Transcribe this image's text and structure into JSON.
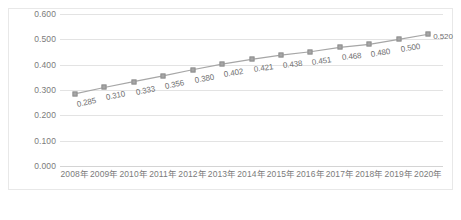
{
  "chart_data": {
    "type": "line",
    "title": "",
    "subtitle": "",
    "xlabel": "",
    "ylabel": "",
    "categories": [
      "2008年",
      "2009年",
      "2010年",
      "2011年",
      "2012年",
      "2013年",
      "2014年",
      "2015年",
      "2016年",
      "2017年",
      "2018年",
      "2019年",
      "2020年"
    ],
    "values": [
      0.285,
      0.31,
      0.333,
      0.356,
      0.38,
      0.402,
      0.421,
      0.438,
      0.451,
      0.468,
      0.48,
      0.5,
      0.52
    ],
    "data_labels": [
      "0.285",
      "0.310",
      "0.333",
      "0.356",
      "0.380",
      "0.402",
      "0.421",
      "0.438",
      "0.451",
      "0.468",
      "0.480",
      "0.500",
      "0.520"
    ],
    "ylim": [
      0.0,
      0.6
    ],
    "ytick_values": [
      0.0,
      0.1,
      0.2,
      0.3,
      0.4,
      0.5,
      0.6
    ],
    "ytick_labels": [
      "0.000",
      "0.100",
      "0.200",
      "0.300",
      "0.400",
      "0.500",
      "0.600"
    ],
    "grid": true,
    "grid_axis": "y",
    "legend": false,
    "legend_position": "none",
    "marker": "square",
    "series_color": "#a6a6a6",
    "line_color": "#a6a6a6",
    "grid_color": "#e3e3e3",
    "label_text_color": "#6f6f6f",
    "axis_text_color": "#7b7b7b"
  },
  "caption": {
    "text": ""
  }
}
